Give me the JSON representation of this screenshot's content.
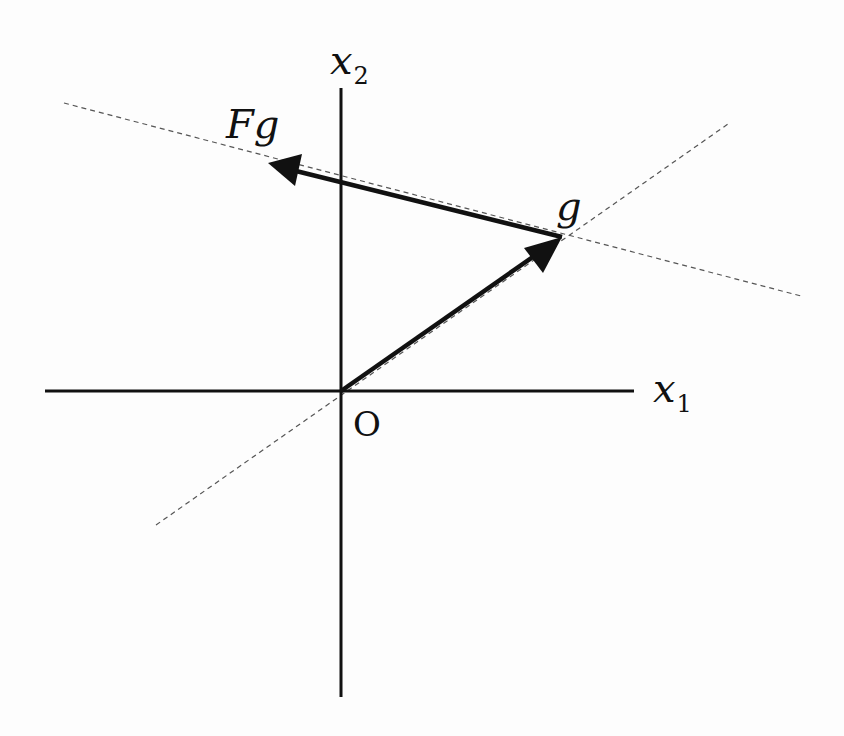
{
  "diagram": {
    "type": "vector-diagram",
    "axes": {
      "x1_label": "x",
      "x1_subscript": "1",
      "x2_label": "x",
      "x2_subscript": "2",
      "origin_label": "O"
    },
    "vectors": [
      {
        "name": "g",
        "label": "g",
        "from": "O",
        "to": "g"
      },
      {
        "name": "Fg",
        "label": "Fg",
        "from": "g",
        "to": "Fg"
      }
    ],
    "dashed_lines": [
      {
        "description": "line through O and g"
      },
      {
        "description": "line through g and Fg"
      }
    ],
    "colors": {
      "ink": "#111111",
      "dashed": "#555555",
      "background": "#fdfdfd"
    }
  }
}
